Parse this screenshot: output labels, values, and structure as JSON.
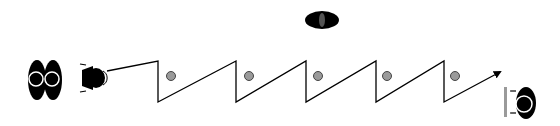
{
  "diagram": {
    "type": "movement-path",
    "width": 560,
    "height": 126,
    "colors": {
      "background": "#ffffff",
      "figure": "#000000",
      "marker": "#9a9a9a",
      "line": "#000000",
      "outline": "#ffffff"
    },
    "figures": [
      {
        "id": "pair-left",
        "kind": "double-oval-with-rings",
        "x": 51,
        "y": 80
      },
      {
        "id": "mover",
        "kind": "figure-facing-right",
        "x": 93,
        "y": 78
      },
      {
        "id": "top-figure",
        "kind": "oval-with-slot",
        "x": 322,
        "y": 20
      },
      {
        "id": "target",
        "kind": "figure-with-bar",
        "x": 522,
        "y": 104
      }
    ],
    "path": {
      "points": [
        [
          107,
          71
        ],
        [
          158,
          61
        ],
        [
          158,
          102
        ],
        [
          236,
          61
        ],
        [
          236,
          102
        ],
        [
          306,
          61
        ],
        [
          306,
          102
        ],
        [
          376,
          61
        ],
        [
          376,
          102
        ],
        [
          444,
          61
        ],
        [
          444,
          102
        ],
        [
          500,
          72
        ]
      ],
      "arrow_end": true
    },
    "markers": [
      {
        "x": 171,
        "y": 76
      },
      {
        "x": 249,
        "y": 76
      },
      {
        "x": 318,
        "y": 76
      },
      {
        "x": 387,
        "y": 76
      },
      {
        "x": 455,
        "y": 76
      }
    ]
  }
}
